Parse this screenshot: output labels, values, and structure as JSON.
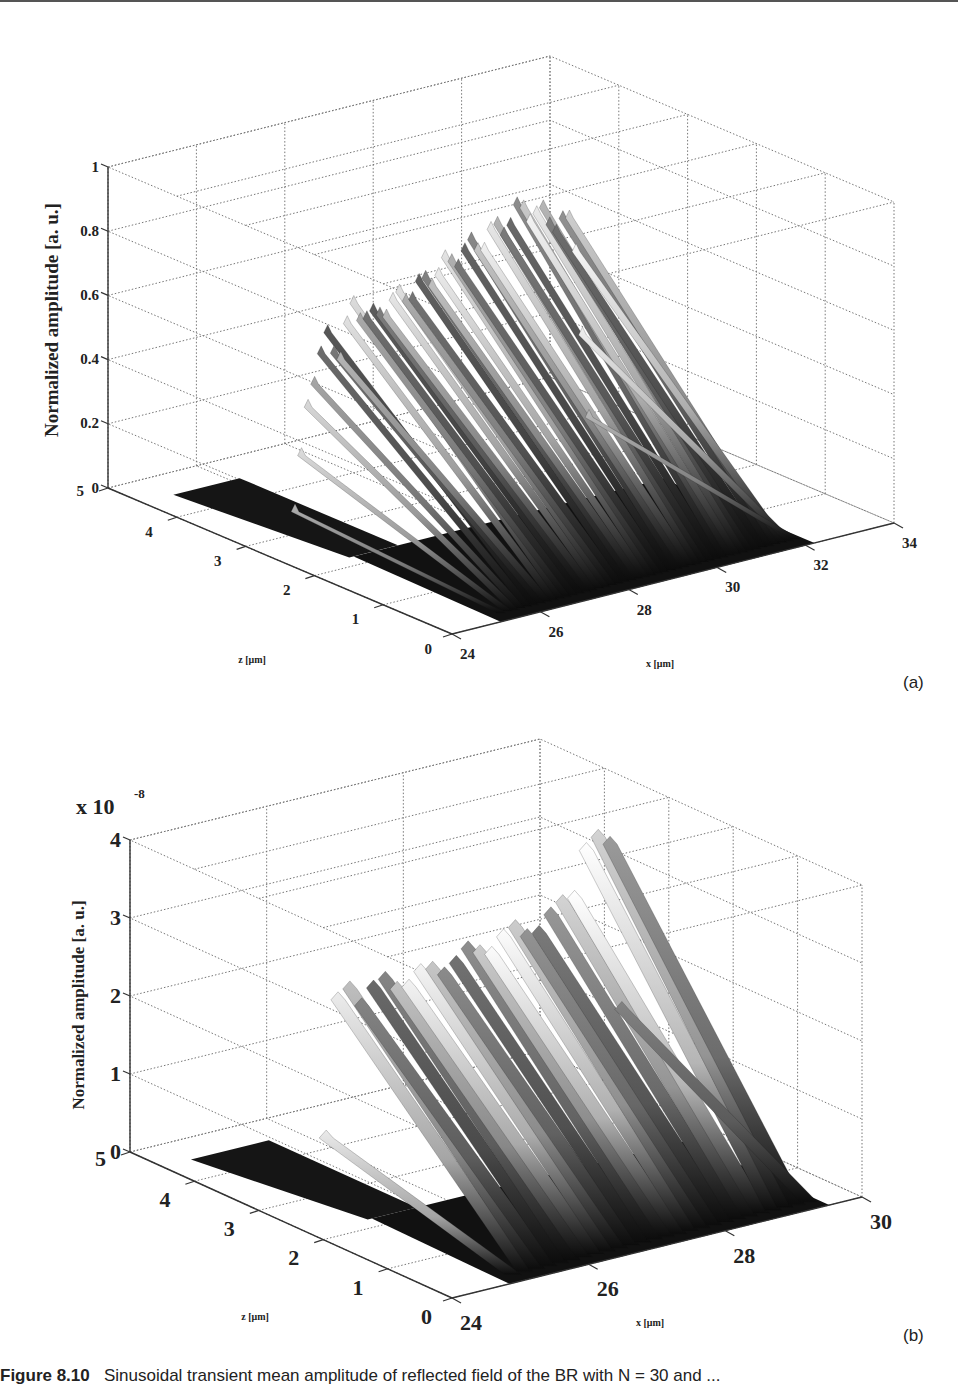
{
  "figure": {
    "caption_label": "Figure 8.10",
    "caption_text": "Sinusoidal transient mean amplitude of reflected field of the BR with N = 30 and ..."
  },
  "chart_data": [
    {
      "type": "surface3d",
      "panel": "(a)",
      "title": "",
      "zlabel": "Normalized amplitude [a. u.]",
      "xlabel": "x [μm]",
      "ylabel": "z [μm]",
      "x_ticks": [
        "24",
        "26",
        "28",
        "30",
        "32",
        "34"
      ],
      "z_depth_ticks": [
        "0",
        "1",
        "2",
        "3",
        "4",
        "5"
      ],
      "amp_ticks": [
        "0",
        "0.2",
        "0.4",
        "0.6",
        "0.8",
        "1"
      ],
      "xlim": [
        24,
        34
      ],
      "depth_lim": [
        0,
        5
      ],
      "amp_lim": [
        0,
        1
      ],
      "amp_multiplier": "",
      "grid": true,
      "colormap": "gray",
      "surface_profile": {
        "description": "Amplitude vs x at far z edge; plateau with dense fringes",
        "x": [
          24.0,
          25.2,
          25.6,
          26.0,
          26.3,
          26.6,
          27.0,
          27.5,
          28.0,
          28.5,
          29.0,
          29.5,
          30.0,
          30.5,
          31.0,
          31.3,
          31.6,
          32.0
        ],
        "amp": [
          0.0,
          0.0,
          0.45,
          0.62,
          0.55,
          0.7,
          0.64,
          0.68,
          0.7,
          0.74,
          0.78,
          0.8,
          0.84,
          0.88,
          0.82,
          0.8,
          0.78,
          0.0
        ],
        "step_z": 2.2,
        "note": "For z > ~2.2 only a narrow region near x=24-26 is nonzero"
      }
    },
    {
      "type": "surface3d",
      "panel": "(b)",
      "title": "",
      "zlabel": "Normalized amplitude [a. u.]",
      "xlabel": "x [μm]",
      "ylabel": "z [μm]",
      "x_ticks": [
        "24",
        "26",
        "28",
        "30"
      ],
      "z_depth_ticks": [
        "0",
        "1",
        "2",
        "3",
        "4",
        "5"
      ],
      "amp_ticks": [
        "0",
        "1",
        "2",
        "3",
        "4"
      ],
      "xlim": [
        24,
        30
      ],
      "depth_lim": [
        0,
        5
      ],
      "amp_lim": [
        0,
        4
      ],
      "amp_multiplier": "x 10^-8",
      "grid": true,
      "colormap": "gray",
      "surface_profile": {
        "description": "Amplitude (x1e-8) vs x at far z edge; periodic lobes, larger near x=29",
        "x": [
          24.0,
          24.9,
          25.2,
          25.5,
          25.9,
          26.3,
          26.7,
          27.1,
          27.5,
          27.9,
          28.3,
          28.6,
          28.8,
          29.0,
          29.2,
          29.4
        ],
        "amp": [
          0.0,
          0.0,
          2.95,
          2.6,
          2.7,
          2.65,
          2.75,
          2.8,
          2.9,
          2.95,
          3.0,
          3.3,
          3.9,
          3.8,
          3.85,
          0.0
        ],
        "step_z": 2.2
      }
    }
  ],
  "labels": {
    "panel_a": "(a)",
    "panel_b": "(b)",
    "exp_base": "x 10",
    "exp_power": "-8"
  }
}
